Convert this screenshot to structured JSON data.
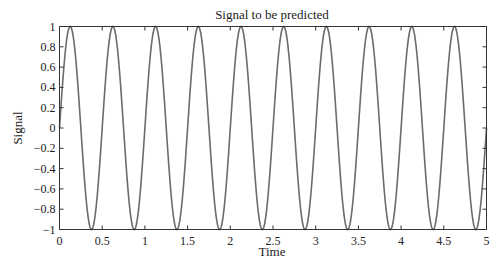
{
  "chart_data": {
    "type": "line",
    "title": "Signal to be predicted",
    "xlabel": "Time",
    "ylabel": "Signal",
    "xlim": [
      0,
      5
    ],
    "ylim": [
      -1,
      1
    ],
    "xticks": [
      "0",
      "0.5",
      "1",
      "1.5",
      "2",
      "2.5",
      "3",
      "3.5",
      "4",
      "4.5",
      "5"
    ],
    "yticks": [
      "-1",
      "-0.8",
      "-0.6",
      "-0.4",
      "-0.2",
      "0",
      "0.2",
      "0.4",
      "0.6",
      "0.8",
      "1"
    ],
    "grid": false,
    "legend": null,
    "series": [
      {
        "name": "signal",
        "function": "sin(2*pi*2*t)",
        "frequency_hz": 2,
        "amplitude": 1,
        "color": "#6b6b6b",
        "x_start": 0,
        "x_end": 5,
        "samples": 1001
      }
    ]
  },
  "colors": {
    "line": "#6b6b6b",
    "axes": "#333333"
  }
}
